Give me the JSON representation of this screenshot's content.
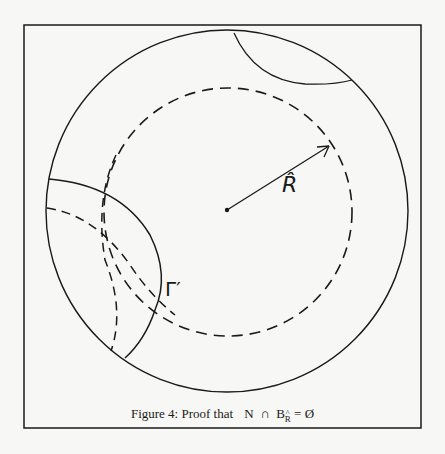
{
  "figure": {
    "caption_prefix": "Figure 4:  Proof that",
    "caption_math_N": "N",
    "caption_math_cap": "∩",
    "caption_math_B": "B",
    "caption_math_sub": "R",
    "caption_math_eq": "= Ø",
    "labels": {
      "radius": "R̂",
      "gamma": "Γ′"
    },
    "colors": {
      "stroke": "#1a1a1a",
      "background": "#f7f7f5"
    },
    "geometry": {
      "center": [
        227,
        210
      ],
      "outer_circle_radius": 181,
      "inner_dashed_circle_radius": 124,
      "arrow_tip": [
        330,
        145
      ]
    }
  }
}
